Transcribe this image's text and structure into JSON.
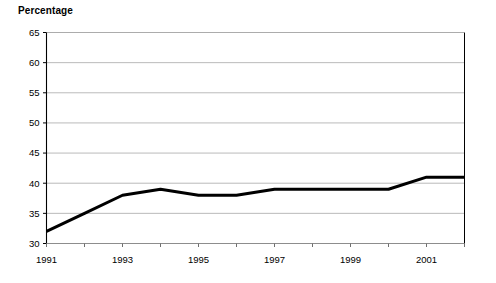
{
  "chart": {
    "title": "Percentage",
    "axis_color": "#000000",
    "grid_color": "#a8a8a8",
    "series_color": "#000000",
    "background": "#ffffff"
  },
  "chart_data": {
    "type": "line",
    "title": "Percentage",
    "xlabel": "",
    "ylabel": "Percentage",
    "ylim": [
      30,
      65
    ],
    "ytick_step": 5,
    "yticks": [
      30,
      35,
      40,
      45,
      50,
      55,
      60,
      65
    ],
    "ytick_labels": [
      "30",
      "35",
      "40",
      "45",
      "50",
      "55",
      "60",
      "65"
    ],
    "xlim": [
      1991,
      2002
    ],
    "x": [
      1991,
      1992,
      1993,
      1994,
      1995,
      1996,
      1997,
      1998,
      1999,
      2000,
      2001,
      2002
    ],
    "xticks": [
      1991,
      1992,
      1993,
      1994,
      1995,
      1996,
      1997,
      1998,
      1999,
      2000,
      2001,
      2002
    ],
    "xtick_labels": [
      "1991",
      "",
      "1993",
      "",
      "1995",
      "",
      "1997",
      "",
      "1999",
      "",
      "2001",
      ""
    ],
    "xtick_labels_shown": [
      "1991",
      "1993",
      "1995",
      "1997",
      "1999",
      "2001"
    ],
    "series": [
      {
        "name": "Percentage",
        "values": [
          32,
          35,
          38,
          39,
          38,
          38,
          39,
          39,
          39,
          39,
          41,
          41
        ]
      }
    ],
    "grid": true,
    "grid_axis": "y",
    "legend": false,
    "legend_position": "none",
    "line_width_px": 3,
    "markers": false
  }
}
